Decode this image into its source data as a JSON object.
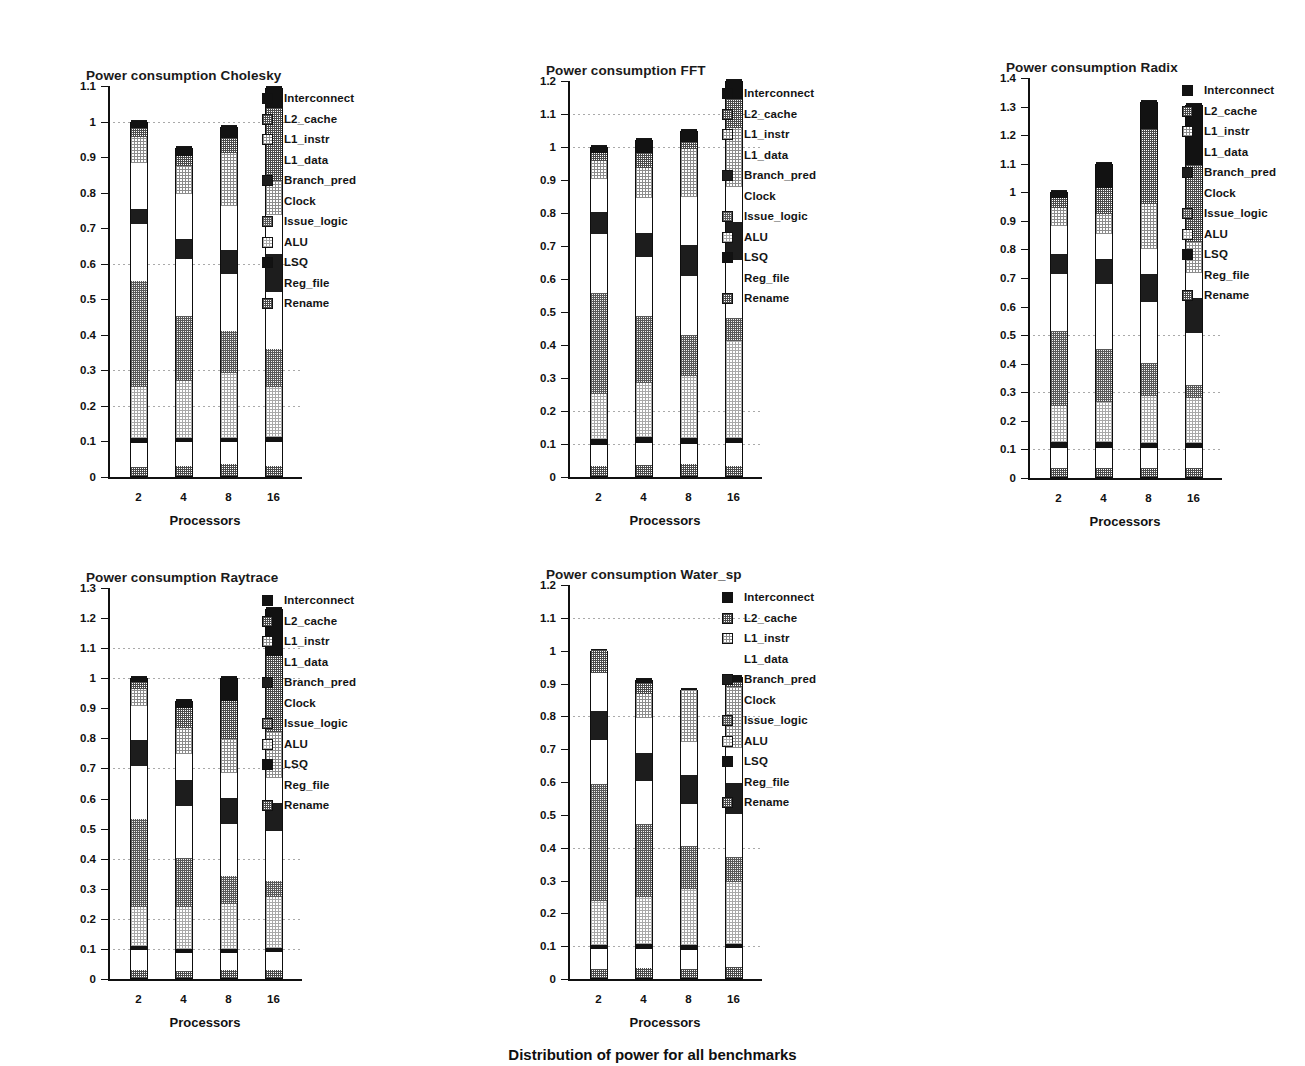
{
  "figure": {
    "caption": "Distribution of power for all benchmarks",
    "xtitle": "Processors",
    "categories": [
      "2",
      "4",
      "8",
      "16"
    ]
  },
  "legend": {
    "entries": [
      {
        "label": "Interconnect",
        "fill": "black"
      },
      {
        "label": "L2_cache",
        "fill": "mid"
      },
      {
        "label": "L1_instr",
        "fill": "light"
      },
      {
        "label": "L1_data",
        "fill": "white"
      },
      {
        "label": "Branch_pred",
        "fill": "dark"
      },
      {
        "label": "Clock",
        "fill": "white"
      },
      {
        "label": "Issue_logic",
        "fill": "midgray"
      },
      {
        "label": "ALU",
        "fill": "lighter"
      },
      {
        "label": "LSQ",
        "fill": "black"
      },
      {
        "label": "Reg_file",
        "fill": "white"
      },
      {
        "label": "Rename",
        "fill": "mid"
      }
    ]
  },
  "chart_data": [
    {
      "type": "bar",
      "stacked": true,
      "title": "Power consumption Cholesky",
      "xlabel": "Processors",
      "ylabel": "",
      "categories": [
        "2",
        "4",
        "8",
        "16"
      ],
      "ylim": [
        0,
        1.1
      ],
      "yticks": [
        "0",
        "0.1",
        "0.2",
        "0.3",
        "0.4",
        "0.5",
        "0.6",
        "0.7",
        "0.8",
        "0.9",
        "1",
        "1.1"
      ],
      "gridlines": [
        0.2,
        0.3,
        0.6,
        1.0
      ],
      "totals": [
        1.0,
        0.925,
        0.985,
        1.095
      ],
      "series": [
        {
          "name": "Rename",
          "values": [
            0.025,
            0.028,
            0.033,
            0.028
          ]
        },
        {
          "name": "Reg_file",
          "values": [
            0.068,
            0.067,
            0.063,
            0.068
          ]
        },
        {
          "name": "LSQ",
          "values": [
            0.015,
            0.013,
            0.012,
            0.013
          ]
        },
        {
          "name": "ALU",
          "values": [
            0.142,
            0.158,
            0.182,
            0.142
          ]
        },
        {
          "name": "Issue_logic",
          "values": [
            0.3,
            0.184,
            0.117,
            0.107
          ]
        },
        {
          "name": "Clock",
          "values": [
            0.16,
            0.16,
            0.16,
            0.16
          ]
        },
        {
          "name": "Branch_pred",
          "values": [
            0.04,
            0.058,
            0.068,
            0.107
          ]
        },
        {
          "name": "L1_data",
          "values": [
            0.13,
            0.125,
            0.125,
            0.11
          ]
        },
        {
          "name": "L1_instr",
          "values": [
            0.075,
            0.078,
            0.15,
            0.095
          ]
        },
        {
          "name": "L2_cache",
          "values": [
            0.025,
            0.03,
            0.04,
            0.205
          ]
        },
        {
          "name": "Interconnect",
          "values": [
            0.02,
            0.024,
            0.035,
            0.06
          ]
        }
      ]
    },
    {
      "type": "bar",
      "stacked": true,
      "title": "Power consumption FFT",
      "xlabel": "Processors",
      "ylabel": "",
      "categories": [
        "2",
        "4",
        "8",
        "16"
      ],
      "ylim": [
        0,
        1.2
      ],
      "yticks": [
        "0",
        "0.1",
        "0.2",
        "0.3",
        "0.4",
        "0.5",
        "0.6",
        "0.7",
        "0.8",
        "0.9",
        "1",
        "1.1",
        "1.2"
      ],
      "gridlines": [
        0.1,
        0.2,
        1.0,
        1.1
      ],
      "totals": [
        1.0,
        1.02,
        1.05,
        1.2
      ],
      "series": [
        {
          "name": "Rename",
          "values": [
            0.03,
            0.033,
            0.035,
            0.03
          ]
        },
        {
          "name": "Reg_file",
          "values": [
            0.065,
            0.068,
            0.063,
            0.07
          ]
        },
        {
          "name": "LSQ",
          "values": [
            0.018,
            0.018,
            0.016,
            0.015
          ]
        },
        {
          "name": "ALU",
          "values": [
            0.137,
            0.163,
            0.188,
            0.293
          ]
        },
        {
          "name": "Issue_logic",
          "values": [
            0.305,
            0.203,
            0.125,
            0.072
          ]
        },
        {
          "name": "Clock",
          "values": [
            0.178,
            0.178,
            0.178,
            0.175
          ]
        },
        {
          "name": "Branch_pred",
          "values": [
            0.067,
            0.073,
            0.095,
            0.115
          ]
        },
        {
          "name": "L1_data",
          "values": [
            0.1,
            0.105,
            0.145,
            0.107
          ]
        },
        {
          "name": "L1_instr",
          "values": [
            0.055,
            0.092,
            0.145,
            0.178
          ]
        },
        {
          "name": "L2_cache",
          "values": [
            0.025,
            0.047,
            0.023,
            0.087
          ]
        },
        {
          "name": "Interconnect",
          "values": [
            0.02,
            0.04,
            0.037,
            0.058
          ]
        }
      ]
    },
    {
      "type": "bar",
      "stacked": true,
      "title": "Power consumption Radix",
      "xlabel": "Processors",
      "ylabel": "",
      "categories": [
        "2",
        "4",
        "8",
        "16"
      ],
      "ylim": [
        0,
        1.4
      ],
      "yticks": [
        "0",
        "0.1",
        "0.2",
        "0.3",
        "0.4",
        "0.5",
        "0.6",
        "0.7",
        "0.8",
        "0.9",
        "1",
        "1.1",
        "1.2",
        "1.3",
        "1.4"
      ],
      "gridlines": [
        0.1,
        0.3,
        0.5
      ],
      "totals": [
        1.0,
        1.1,
        1.315,
        1.305
      ],
      "series": [
        {
          "name": "Rename",
          "values": [
            0.03,
            0.032,
            0.032,
            0.03
          ]
        },
        {
          "name": "Reg_file",
          "values": [
            0.072,
            0.07,
            0.068,
            0.07
          ]
        },
        {
          "name": "LSQ",
          "values": [
            0.02,
            0.022,
            0.02,
            0.02
          ]
        },
        {
          "name": "ALU",
          "values": [
            0.125,
            0.14,
            0.163,
            0.155
          ]
        },
        {
          "name": "Issue_logic",
          "values": [
            0.263,
            0.185,
            0.117,
            0.048
          ]
        },
        {
          "name": "Clock",
          "values": [
            0.2,
            0.227,
            0.212,
            0.18
          ]
        },
        {
          "name": "Branch_pred",
          "values": [
            0.072,
            0.087,
            0.1,
            0.125
          ]
        },
        {
          "name": "L1_data",
          "values": [
            0.095,
            0.088,
            0.085,
            0.085
          ]
        },
        {
          "name": "L1_instr",
          "values": [
            0.065,
            0.07,
            0.157,
            0.11
          ]
        },
        {
          "name": "L2_cache",
          "values": [
            0.035,
            0.09,
            0.265,
            0.27
          ]
        },
        {
          "name": "Interconnect",
          "values": [
            0.023,
            0.089,
            0.096,
            0.212
          ]
        }
      ]
    },
    {
      "type": "bar",
      "stacked": true,
      "title": "Power consumption Raytrace",
      "xlabel": "Processors",
      "ylabel": "",
      "categories": [
        "2",
        "4",
        "8",
        "16"
      ],
      "ylim": [
        0,
        1.3
      ],
      "yticks": [
        "0",
        "0.1",
        "0.2",
        "0.3",
        "0.4",
        "0.5",
        "0.6",
        "0.7",
        "0.8",
        "0.9",
        "1",
        "1.1",
        "1.2",
        "1.3"
      ],
      "gridlines": [
        0.1,
        0.2,
        0.4,
        0.7,
        1.0,
        1.1
      ],
      "totals": [
        1.0,
        0.925,
        1.0,
        1.23
      ],
      "series": [
        {
          "name": "Rename",
          "values": [
            0.027,
            0.024,
            0.027,
            0.028
          ]
        },
        {
          "name": "Reg_file",
          "values": [
            0.065,
            0.06,
            0.057,
            0.058
          ]
        },
        {
          "name": "LSQ",
          "values": [
            0.015,
            0.014,
            0.014,
            0.015
          ]
        },
        {
          "name": "ALU",
          "values": [
            0.13,
            0.137,
            0.147,
            0.167
          ]
        },
        {
          "name": "Issue_logic",
          "values": [
            0.293,
            0.165,
            0.095,
            0.053
          ]
        },
        {
          "name": "Clock",
          "values": [
            0.175,
            0.173,
            0.173,
            0.168
          ]
        },
        {
          "name": "Branch_pred",
          "values": [
            0.085,
            0.087,
            0.087,
            0.093
          ]
        },
        {
          "name": "L1_data",
          "values": [
            0.115,
            0.085,
            0.08,
            0.082
          ]
        },
        {
          "name": "L1_instr",
          "values": [
            0.055,
            0.085,
            0.115,
            0.155
          ]
        },
        {
          "name": "L2_cache",
          "values": [
            0.023,
            0.067,
            0.125,
            0.253
          ]
        },
        {
          "name": "Interconnect",
          "values": [
            0.017,
            0.028,
            0.08,
            0.158
          ]
        }
      ]
    },
    {
      "type": "bar",
      "stacked": true,
      "title": "Power consumption Water_sp",
      "xlabel": "Processors",
      "ylabel": "",
      "categories": [
        "2",
        "4",
        "8",
        "16"
      ],
      "ylim": [
        0,
        1.2
      ],
      "yticks": [
        "0",
        "0.1",
        "0.2",
        "0.3",
        "0.4",
        "0.5",
        "0.6",
        "0.7",
        "0.8",
        "0.9",
        "1",
        "1.1",
        "1.2"
      ],
      "gridlines": [
        0.1,
        0.4,
        0.8,
        1.1
      ],
      "totals": [
        1.0,
        0.912,
        0.88,
        0.92
      ],
      "series": [
        {
          "name": "Rename",
          "values": [
            0.027,
            0.03,
            0.028,
            0.033
          ]
        },
        {
          "name": "Reg_file",
          "values": [
            0.06,
            0.058,
            0.058,
            0.057
          ]
        },
        {
          "name": "LSQ",
          "values": [
            0.015,
            0.015,
            0.015,
            0.013
          ]
        },
        {
          "name": "ALU",
          "values": [
            0.133,
            0.143,
            0.17,
            0.19
          ]
        },
        {
          "name": "Issue_logic",
          "values": [
            0.355,
            0.222,
            0.13,
            0.077
          ]
        },
        {
          "name": "Clock",
          "values": [
            0.135,
            0.133,
            0.128,
            0.13
          ]
        },
        {
          "name": "Branch_pred",
          "values": [
            0.088,
            0.085,
            0.09,
            0.095
          ]
        },
        {
          "name": "L1_data",
          "values": [
            0.115,
            0.105,
            0.1,
            0.105
          ]
        },
        {
          "name": "L1_instr",
          "values": [
            0.0,
            0.073,
            0.16,
            0.185
          ]
        },
        {
          "name": "L2_cache",
          "values": [
            0.072,
            0.033,
            0.0,
            0.018
          ]
        },
        {
          "name": "Interconnect",
          "values": [
            0.0,
            0.015,
            0.001,
            0.017
          ]
        }
      ]
    }
  ],
  "panels": [
    {
      "title_x": 86,
      "title_y": 68,
      "plot_x": 108,
      "plot_y": 86,
      "plot_w": 180,
      "plot_h": 391,
      "legend_x": 262,
      "legend_y": 89
    },
    {
      "title_x": 546,
      "title_y": 63,
      "plot_x": 568,
      "plot_y": 81,
      "plot_w": 180,
      "plot_h": 396,
      "legend_x": 722,
      "legend_y": 84
    },
    {
      "title_x": 1006,
      "title_y": 60,
      "plot_x": 1028,
      "plot_y": 78,
      "plot_w": 180,
      "plot_h": 400,
      "legend_x": 1182,
      "legend_y": 81
    },
    {
      "title_x": 86,
      "title_y": 570,
      "plot_x": 108,
      "plot_y": 588,
      "plot_w": 180,
      "plot_h": 391,
      "legend_x": 262,
      "legend_y": 591
    },
    {
      "title_x": 546,
      "title_y": 567,
      "plot_x": 568,
      "plot_y": 585,
      "plot_w": 180,
      "plot_h": 394,
      "legend_x": 722,
      "legend_y": 588
    }
  ],
  "caption_y": 1046
}
